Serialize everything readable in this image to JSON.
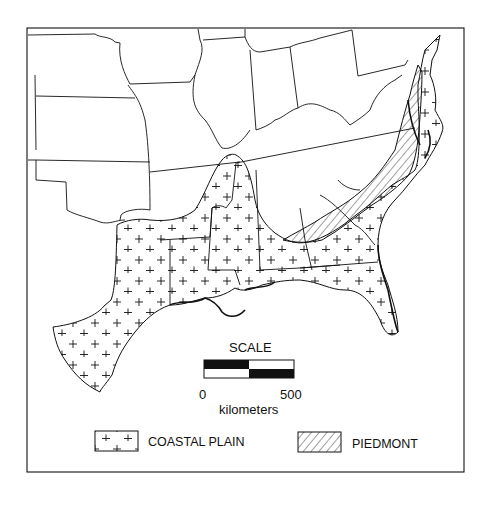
{
  "map": {
    "title": "",
    "region": "Southeastern United States",
    "colors": {
      "line": "#111111",
      "background": "#ffffff"
    },
    "scale": {
      "title": "SCALE",
      "start_label": "0",
      "end_label": "500",
      "unit": "kilometers"
    },
    "legend": [
      {
        "label": "COASTAL PLAIN",
        "pattern": "plus-signs"
      },
      {
        "label": "PIEDMONT",
        "pattern": "diagonal-hatch"
      }
    ]
  }
}
